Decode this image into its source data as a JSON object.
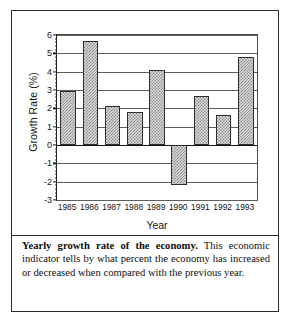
{
  "figure": {
    "caption_lead": "Yearly growth rate of the economy.",
    "caption_body": " This economic indicator tells by what percent the economy has increased or decreased when compared with the previous year."
  },
  "chart_data": {
    "type": "bar",
    "title": "Yearly growth rate of the economy",
    "xlabel": "Year",
    "ylabel": "Growth Rate (%)",
    "categories": [
      "1985",
      "1986",
      "1987",
      "1988",
      "1989",
      "1990",
      "1991",
      "1992",
      "1993"
    ],
    "values": [
      2.95,
      5.65,
      2.15,
      1.78,
      4.1,
      -2.2,
      2.7,
      1.65,
      4.8
    ],
    "ylim": [
      -3,
      6
    ],
    "yticks": [
      6,
      5,
      4,
      3,
      2,
      1,
      0,
      -1,
      -2,
      -3
    ],
    "ytick_labels": [
      "6",
      "5",
      "4",
      "3",
      "2",
      "1",
      "0",
      "-1",
      "-2",
      "-3"
    ],
    "minor_ticks_per_interval": 4,
    "grid": true,
    "grid_axis": "y",
    "legend": "none",
    "bar_fill": "#d8d8d8",
    "bar_hatch_color": "#8e8e8e",
    "bar_edge_color": "#2e2e2e",
    "axis_color": "#1a1a1a"
  }
}
